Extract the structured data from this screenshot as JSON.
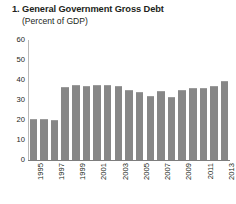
{
  "chart_data": {
    "type": "bar",
    "title": "1. General Government Gross Debt",
    "subtitle": "(Percent of GDP)",
    "xlabel": "",
    "ylabel": "",
    "ylim": [
      0,
      60
    ],
    "yticks": [
      0,
      10,
      20,
      30,
      40,
      50,
      60
    ],
    "ytick_labels": [
      "0",
      "10",
      "20",
      "30",
      "40",
      "50",
      "60"
    ],
    "grid": false,
    "legend": "none",
    "bar_color": "#878787",
    "categories": [
      "1995",
      "1996",
      "1997",
      "1998",
      "1999",
      "2000",
      "2001",
      "2002",
      "2003",
      "2004",
      "2005",
      "2006",
      "2007",
      "2008",
      "2009",
      "2010",
      "2011",
      "2012",
      "2013"
    ],
    "xtick_labels": [
      "1995",
      "1997",
      "1999",
      "2001",
      "2003",
      "2005",
      "2007",
      "2009",
      "2011",
      "2013"
    ],
    "values": [
      20.5,
      20.5,
      20.0,
      36.5,
      37.5,
      37.0,
      37.5,
      37.5,
      37.0,
      35.0,
      34.0,
      32.0,
      34.5,
      31.5,
      35.0,
      36.0,
      36.0,
      37.0,
      39.5
    ]
  }
}
